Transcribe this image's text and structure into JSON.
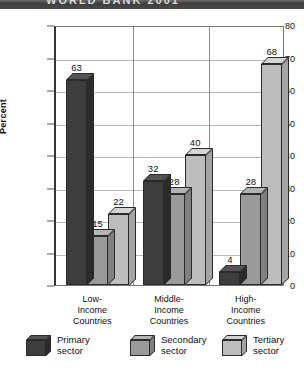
{
  "title_band": {
    "text": "WORLD BANK 2001"
  },
  "chart_data": {
    "type": "bar",
    "title": "",
    "subtitle": "",
    "xlabel": "",
    "ylabel": "Percent",
    "ylim": [
      0,
      80
    ],
    "ytick_values": [
      0,
      10,
      20,
      30,
      40,
      50,
      60,
      70,
      80
    ],
    "ytick_labels": [
      "0",
      "10",
      "20",
      "30",
      "40",
      "50",
      "60",
      "70",
      "80"
    ],
    "grid": "horizontal-and-group-separators",
    "legend_position": "bottom",
    "categories": [
      "Low-\nIncome\nCountries",
      "Middle-\nIncome\nCountries",
      "High-\nIncome\nCountries"
    ],
    "category_lines": [
      [
        "Low-",
        "Income",
        "Countries"
      ],
      [
        "Middle-",
        "Income",
        "Countries"
      ],
      [
        "High-",
        "Income",
        "Countries"
      ]
    ],
    "series": [
      {
        "name": "Primary sector",
        "color": "#3d3d3d",
        "top_color": "#545454",
        "side_color": "#2b2b2b",
        "values": [
          63,
          32,
          4
        ]
      },
      {
        "name": "Secondary sector",
        "color": "#9a9a9a",
        "top_color": "#b4b4b4",
        "side_color": "#808080",
        "values": [
          15,
          28,
          28
        ]
      },
      {
        "name": "Tertiary sector",
        "color": "#bdbdbd",
        "top_color": "#d4d4d4",
        "side_color": "#a4a4a4",
        "values": [
          22,
          40,
          68
        ]
      }
    ],
    "value_labels": [
      [
        "63",
        "15",
        "22"
      ],
      [
        "32",
        "28",
        "40"
      ],
      [
        "4",
        "28",
        "68"
      ]
    ]
  },
  "legend": {
    "items": [
      {
        "line1": "Primary",
        "line2": "sector"
      },
      {
        "line1": "Secondary",
        "line2": "sector"
      },
      {
        "line1": "Tertiary",
        "line2": "sector"
      }
    ]
  }
}
